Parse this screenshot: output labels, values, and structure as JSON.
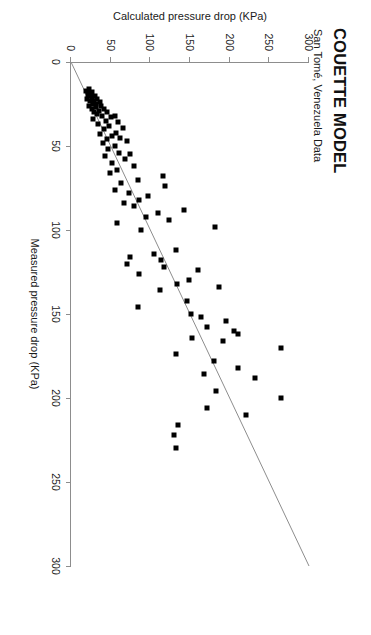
{
  "figure": {
    "title": "COUETTE MODEL",
    "subtitle": "San Tomé, Venezuela Data"
  },
  "chart_data": {
    "type": "scatter",
    "title": "COUETTE MODEL",
    "subtitle": "San Tomé, Venezuela Data",
    "xlabel": "Measured pressure drop (KPa)",
    "ylabel": "Calculated pressure drop (KPa)",
    "xlim": [
      0,
      300
    ],
    "ylim": [
      0,
      300
    ],
    "xticks": [
      0,
      50,
      100,
      150,
      200,
      250,
      300
    ],
    "yticks": [
      0,
      50,
      100,
      150,
      200,
      250,
      300
    ],
    "grid": false,
    "legend": null,
    "annotations": [
      {
        "type": "line",
        "name": "unity-line",
        "description": "1:1 reference line from (0,0) to (300,300)",
        "x": [
          0,
          300
        ],
        "y": [
          0,
          300
        ]
      }
    ],
    "series": [
      {
        "name": "Couette model predictions",
        "marker": "filled-square",
        "color": "#000000",
        "points": [
          [
            16,
            23
          ],
          [
            17,
            19
          ],
          [
            18,
            27
          ],
          [
            18,
            21
          ],
          [
            19,
            25
          ],
          [
            20,
            30
          ],
          [
            20,
            22
          ],
          [
            21,
            26
          ],
          [
            22,
            33
          ],
          [
            22,
            20
          ],
          [
            23,
            29
          ],
          [
            23,
            24
          ],
          [
            24,
            36
          ],
          [
            25,
            28
          ],
          [
            25,
            32
          ],
          [
            26,
            38
          ],
          [
            26,
            23
          ],
          [
            27,
            31
          ],
          [
            28,
            42
          ],
          [
            28,
            26
          ],
          [
            29,
            35
          ],
          [
            30,
            46
          ],
          [
            30,
            29
          ],
          [
            31,
            33
          ],
          [
            32,
            55
          ],
          [
            32,
            39
          ],
          [
            33,
            50
          ],
          [
            34,
            28
          ],
          [
            35,
            44
          ],
          [
            36,
            59
          ],
          [
            37,
            34
          ],
          [
            38,
            48
          ],
          [
            39,
            66
          ],
          [
            40,
            41
          ],
          [
            42,
            57
          ],
          [
            43,
            36
          ],
          [
            44,
            52
          ],
          [
            45,
            62
          ],
          [
            46,
            45
          ],
          [
            47,
            71
          ],
          [
            48,
            40
          ],
          [
            50,
            55
          ],
          [
            52,
            47
          ],
          [
            54,
            60
          ],
          [
            55,
            75
          ],
          [
            56,
            43
          ],
          [
            58,
            68
          ],
          [
            60,
            52
          ],
          [
            62,
            80
          ],
          [
            64,
            58
          ],
          [
            66,
            49
          ],
          [
            68,
            116
          ],
          [
            70,
            84
          ],
          [
            72,
            63
          ],
          [
            74,
            118
          ],
          [
            76,
            55
          ],
          [
            78,
            73
          ],
          [
            80,
            97
          ],
          [
            82,
            86
          ],
          [
            84,
            67
          ],
          [
            86,
            79
          ],
          [
            88,
            143
          ],
          [
            90,
            110
          ],
          [
            92,
            95
          ],
          [
            94,
            123
          ],
          [
            96,
            58
          ],
          [
            98,
            182
          ],
          [
            100,
            88
          ],
          [
            112,
            132
          ],
          [
            114,
            105
          ],
          [
            116,
            75
          ],
          [
            118,
            113
          ],
          [
            120,
            70
          ],
          [
            122,
            117
          ],
          [
            124,
            160
          ],
          [
            126,
            86
          ],
          [
            130,
            149
          ],
          [
            132,
            134
          ],
          [
            134,
            186
          ],
          [
            136,
            112
          ],
          [
            142,
            146
          ],
          [
            146,
            84
          ],
          [
            150,
            151
          ],
          [
            152,
            164
          ],
          [
            154,
            196
          ],
          [
            158,
            172
          ],
          [
            160,
            205
          ],
          [
            162,
            211
          ],
          [
            164,
            152
          ],
          [
            166,
            191
          ],
          [
            170,
            265
          ],
          [
            174,
            132
          ],
          [
            178,
            180
          ],
          [
            182,
            211
          ],
          [
            186,
            168
          ],
          [
            188,
            232
          ],
          [
            196,
            183
          ],
          [
            200,
            265
          ],
          [
            206,
            172
          ],
          [
            210,
            220
          ],
          [
            216,
            135
          ],
          [
            222,
            130
          ],
          [
            230,
            132
          ]
        ]
      }
    ]
  }
}
